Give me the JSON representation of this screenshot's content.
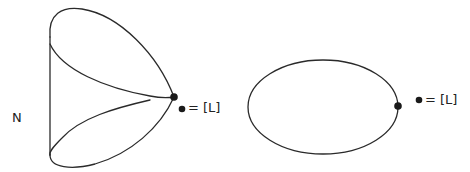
{
  "figures": {
    "left": {
      "manifold_label": "N",
      "legend": {
        "symbol": "●",
        "text": "= [L]"
      }
    },
    "right": {
      "legend": {
        "symbol": "●",
        "text": "= [L]"
      }
    }
  },
  "colors": {
    "stroke": "#2a2a2a",
    "background": "#ffffff"
  }
}
